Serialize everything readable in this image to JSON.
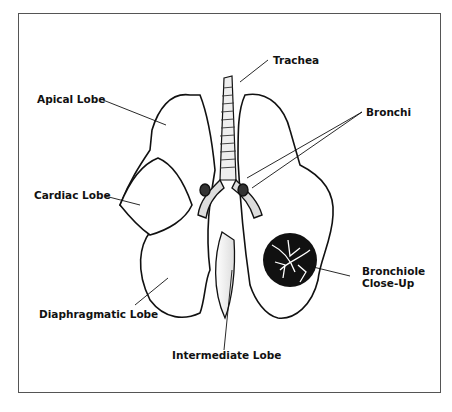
{
  "figure": {
    "labels": {
      "trachea": "Trachea",
      "apical_lobe": "Apical Lobe",
      "bronchi": "Bronchi",
      "cardiac_lobe": "Cardiac Lobe",
      "bronchiole_line1": "Bronchiole",
      "bronchiole_line2": "Close-Up",
      "diaphragmatic_lobe": "Diaphragmatic Lobe",
      "intermediate_lobe": "Intermediate Lobe"
    },
    "colors": {
      "ink": "#111111",
      "frame": "#555555",
      "background": "#ffffff"
    }
  }
}
